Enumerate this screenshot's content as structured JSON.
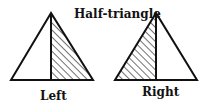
{
  "diagram": {
    "title": "Half-triangle",
    "figures": [
      {
        "label": "Left",
        "hatched_side": "right"
      },
      {
        "label": "Right",
        "hatched_side": "left"
      }
    ],
    "stroke_color": "#111111",
    "background": "#ffffff"
  }
}
